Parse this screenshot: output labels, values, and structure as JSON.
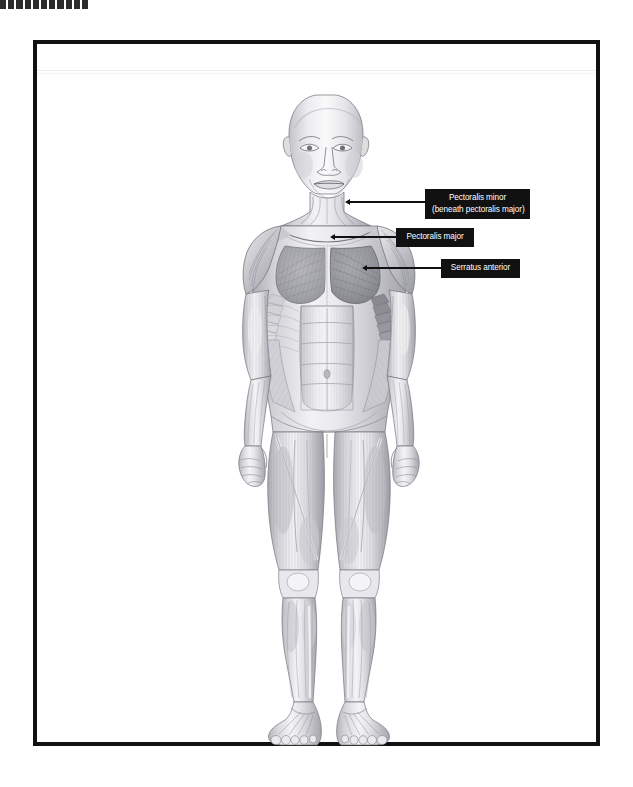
{
  "page": {
    "background_color": "#ffffff",
    "width": 633,
    "height": 787
  },
  "top_marker": {
    "name": "dashed-marker-bar",
    "color": "#2c2c2c",
    "dash_count": 11
  },
  "frame": {
    "border_color": "#111111",
    "border_width": 4,
    "x": 33,
    "y": 40,
    "width": 567,
    "height": 706
  },
  "illustration": {
    "title": "anterior-human-muscular-system",
    "description": "Grayscale pencil-style anatomical drawing of a standing male figure shown from the front with superficial muscles rendered",
    "style": "graphite-pencil-grayscale",
    "view": "anterior",
    "base_tone": "#d8d8da",
    "shadow_tone": "#8d8d92",
    "highlight_tone": "#f6f6f7",
    "highlighted_muscle_tone": "#9a9aa0"
  },
  "labels": [
    {
      "id": "pectoralis-minor",
      "line1": "Pectoralis minor",
      "line2": "(beneath pectoralis major)",
      "background": "#111111",
      "text_color": "#ffffff"
    },
    {
      "id": "pectoralis-major",
      "line1": "Pectoralis major",
      "line2": "",
      "background": "#111111",
      "text_color": "#ffffff"
    },
    {
      "id": "serratus-anterior",
      "line1": "Serratus anterior",
      "line2": "",
      "background": "#111111",
      "text_color": "#ffffff"
    }
  ]
}
